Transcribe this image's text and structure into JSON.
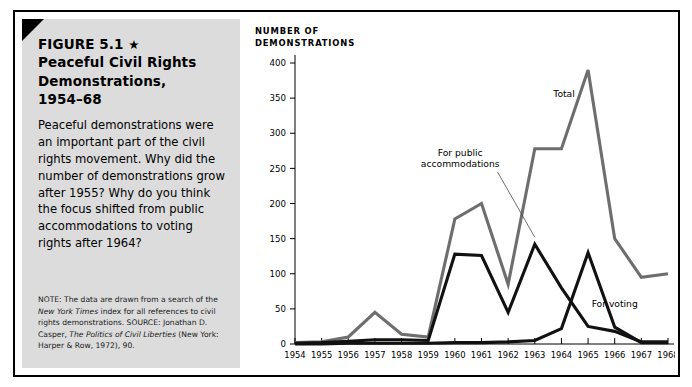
{
  "figure": {
    "label": "FIGURE 5.1",
    "star_glyph": "★",
    "title_line2": "Peaceful Civil Rights",
    "title_line3": "Demonstrations,",
    "title_line4": "1954–68",
    "body": "Peaceful demonstrations were an important part of the civil rights movement. Why did the number of demonstrations grow after 1955? Why do you think the focus shifted from public accommodations to voting rights after 1964?",
    "note_label": "NOTE:",
    "note_text_1": " The data are drawn from a search of the ",
    "note_italic_1": "New York Times",
    "note_text_2": " index for all references to civil rights demonstrations.",
    "source_label": "SOURCE:",
    "source_text_1": " Jonathan D. Casper, ",
    "source_italic_1": "The Politics of Civil Liberties",
    "source_text_2": " (New York: Harper & Row, 1972), 90."
  },
  "colors": {
    "panel_bg": "#dcdcdc",
    "frame": "#000000",
    "total_line": "#6e6e6e",
    "accommodations_line": "#111111",
    "voting_line": "#111111",
    "axis": "#000000"
  },
  "chart_data": {
    "type": "line",
    "xlabel": "",
    "ylabel": "NUMBER OF DEMONSTRATIONS",
    "ylim": [
      0,
      400
    ],
    "yticks": [
      0,
      50,
      100,
      150,
      200,
      250,
      300,
      350,
      400
    ],
    "ytick_labels": [
      "0",
      "50",
      "100",
      "150",
      "200",
      "250",
      "300",
      "350",
      "400"
    ],
    "grid": false,
    "legend_position": "inline-annotations",
    "categories": [
      1954,
      1955,
      1956,
      1957,
      1958,
      1959,
      1960,
      1961,
      1962,
      1963,
      1964,
      1965,
      1966,
      1967,
      1968
    ],
    "xtick_labels": [
      "1954",
      "1955",
      "1956",
      "1957",
      "1958",
      "1959",
      "1960",
      "1961",
      "1962",
      "1963",
      "1964",
      "1965",
      "1966",
      "1967",
      "1968"
    ],
    "series": [
      {
        "name": "Total",
        "color": "#6e6e6e",
        "label_x": 1964.1,
        "label_y": 352,
        "values": [
          2,
          3,
          10,
          45,
          14,
          10,
          178,
          200,
          85,
          278,
          278,
          390,
          150,
          95,
          100
        ]
      },
      {
        "name": "For public accommodations",
        "color": "#111111",
        "label_x": 1960.2,
        "label_y": 268,
        "leader": [
          [
            1961.6,
            245
          ],
          [
            1963.0,
            152
          ]
        ],
        "values": [
          1,
          2,
          4,
          6,
          6,
          5,
          128,
          126,
          45,
          142,
          80,
          25,
          18,
          3,
          3
        ]
      },
      {
        "name": "For voting",
        "color": "#111111",
        "label_x": 1966.0,
        "label_y": 52,
        "values": [
          0,
          0,
          1,
          1,
          1,
          1,
          2,
          2,
          3,
          5,
          22,
          130,
          24,
          2,
          2
        ]
      }
    ]
  }
}
